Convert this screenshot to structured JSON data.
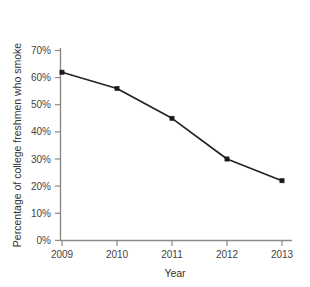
{
  "chart_data": {
    "type": "line",
    "title": "",
    "xlabel": "Year",
    "ylabel": "Percentage of college freshmen who smoke",
    "categories": [
      "2009",
      "2010",
      "2011",
      "2012",
      "2013"
    ],
    "x": [
      2009,
      2010,
      2011,
      2012,
      2013
    ],
    "values": [
      62,
      56,
      45,
      30,
      22
    ],
    "series": [
      {
        "name": "Percentage of college freshmen who smoke",
        "values": [
          62,
          56,
          45,
          30,
          22
        ]
      }
    ],
    "ylim": [
      0,
      70
    ],
    "xlim": [
      2009,
      2013
    ],
    "y_tick_labels": [
      "0%",
      "10%",
      "20%",
      "30%",
      "40%",
      "50%",
      "60%",
      "70%"
    ],
    "y_tick_values": [
      0,
      10,
      20,
      30,
      40,
      50,
      60,
      70
    ],
    "x_tick_labels": [
      "2009",
      "2010",
      "2011",
      "2012",
      "2013"
    ],
    "grid": false,
    "legend": false,
    "legend_position": "none",
    "marker": "square",
    "colors": {
      "line": "#232323",
      "marker": "#1a1a1a",
      "axis": "#8a8a8a",
      "text": "#3a3a3a",
      "background": "#ffffff"
    }
  },
  "axes": {
    "y_title": "Percentage of college freshmen who smoke",
    "x_title": "Year",
    "y_ticks": [
      {
        "label": "70%",
        "value": 70
      },
      {
        "label": "60%",
        "value": 60
      },
      {
        "label": "50%",
        "value": 50
      },
      {
        "label": "40%",
        "value": 40
      },
      {
        "label": "30%",
        "value": 30
      },
      {
        "label": "20%",
        "value": 20
      },
      {
        "label": "10%",
        "value": 10
      },
      {
        "label": "0%",
        "value": 0
      }
    ],
    "x_ticks": [
      {
        "label": "2009",
        "value": 2009
      },
      {
        "label": "2010",
        "value": 2010
      },
      {
        "label": "2011",
        "value": 2011
      },
      {
        "label": "2012",
        "value": 2012
      },
      {
        "label": "2013",
        "value": 2013
      }
    ]
  },
  "points": [
    {
      "year": "2009",
      "percent": 62
    },
    {
      "year": "2010",
      "percent": 56
    },
    {
      "year": "2011",
      "percent": 45
    },
    {
      "year": "2012",
      "percent": 30
    },
    {
      "year": "2013",
      "percent": 22
    }
  ]
}
